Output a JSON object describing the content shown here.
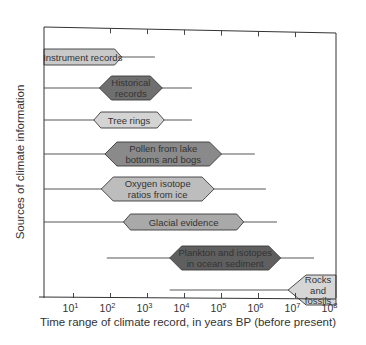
{
  "chart_data": {
    "type": "range-bar",
    "title": "",
    "xlabel": "Time range of climate record, in years BP (before present)",
    "ylabel": "Sources of climate information",
    "x_scale": "log10",
    "xlim_log10": [
      0.2,
      8.1
    ],
    "x_ticks": [
      {
        "exp": 1,
        "base": "10",
        "sup": "1"
      },
      {
        "exp": 2,
        "base": "10",
        "sup": "2"
      },
      {
        "exp": 3,
        "base": "10",
        "sup": "3"
      },
      {
        "exp": 4,
        "base": "10",
        "sup": "4"
      },
      {
        "exp": 5,
        "base": "10",
        "sup": "5"
      },
      {
        "exp": 6,
        "base": "10",
        "sup": "6"
      },
      {
        "exp": 7,
        "base": "10",
        "sup": "7"
      },
      {
        "exp": 8,
        "base": "10",
        "sup": "8"
      }
    ],
    "grid": false,
    "categories": [
      "Instrument records",
      "Historical records",
      "Tree rings",
      "Pollen from lake bottoms and bogs",
      "Oxygen isotope ratios from ice",
      "Glacial evidence",
      "Plankton and isotopes in ocean sediment",
      "Rocks and fossils"
    ],
    "series": [
      {
        "name": "Instrument records",
        "label_lines": [
          "Instrument records"
        ],
        "range_log10": [
          0.2,
          3.2
        ],
        "core_log10": [
          0.2,
          2.3
        ],
        "fill": "#c9c9c9",
        "shade": "light"
      },
      {
        "name": "Historical records",
        "label_lines": [
          "Historical",
          "records"
        ],
        "range_log10": [
          0.2,
          4.2
        ],
        "core_log10": [
          1.7,
          3.4
        ],
        "fill": "#6f6f6f",
        "shade": "dark"
      },
      {
        "name": "Tree rings",
        "label_lines": [
          "Tree rings"
        ],
        "range_log10": [
          0.2,
          4.2
        ],
        "core_log10": [
          1.55,
          3.45
        ],
        "fill": "#d4d4d4",
        "shade": "light"
      },
      {
        "name": "Pollen from lake bottoms and bogs",
        "label_lines": [
          "Pollen from lake",
          "bottoms and bogs"
        ],
        "range_log10": [
          0.2,
          5.9
        ],
        "core_log10": [
          1.85,
          5.0
        ],
        "fill": "#8a8a8a",
        "shade": "medium"
      },
      {
        "name": "Oxygen isotope ratios from ice",
        "label_lines": [
          "Oxygen isotope",
          "ratios from ice"
        ],
        "range_log10": [
          0.2,
          6.2
        ],
        "core_log10": [
          1.75,
          4.8
        ],
        "fill": "#bdbdbd",
        "shade": "light"
      },
      {
        "name": "Glacial evidence",
        "label_lines": [
          "Glacial evidence"
        ],
        "range_log10": [
          0.2,
          6.5
        ],
        "core_log10": [
          2.35,
          5.6
        ],
        "fill": "#a9a9a9",
        "shade": "medium"
      },
      {
        "name": "Plankton and isotopes in ocean sediment",
        "label_lines": [
          "Plankton and isotopes",
          "in ocean sediment"
        ],
        "range_log10": [
          1.9,
          7.5
        ],
        "core_log10": [
          3.6,
          6.6
        ],
        "fill": "#5f5f5f",
        "shade": "dark"
      },
      {
        "name": "Rocks and fossils",
        "label_lines": [
          "Rocks",
          "and",
          "fossils"
        ],
        "range_log10": [
          3.6,
          8.1
        ],
        "core_log10": [
          6.8,
          8.1
        ],
        "fill": "#d6d6d6",
        "shade": "light"
      }
    ],
    "legend": null
  }
}
